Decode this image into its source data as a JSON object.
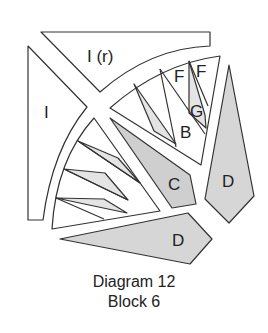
{
  "header_fragment": "(continuing...)",
  "diagram": {
    "pieces": [
      {
        "id": "I-r",
        "label": "I (r)",
        "fill": "#ffffff"
      },
      {
        "id": "I",
        "label": "I",
        "fill": "#ffffff"
      },
      {
        "id": "F1",
        "label": "F",
        "fill": "#ffffff"
      },
      {
        "id": "F2",
        "label": "F",
        "fill": "#ffffff"
      },
      {
        "id": "G",
        "label": "G",
        "fill": "#e4e4e4"
      },
      {
        "id": "B",
        "label": "B",
        "fill": "#ffffff"
      },
      {
        "id": "C",
        "label": "C",
        "fill": "#cfcfcf"
      },
      {
        "id": "D1",
        "label": "D",
        "fill": "#d6d6d6"
      },
      {
        "id": "D2",
        "label": "D",
        "fill": "#d6d6d6"
      }
    ],
    "colors": {
      "stroke": "#333333",
      "light_fill": "#e6e6e6",
      "mid_fill": "#d2d2d2",
      "white": "#ffffff"
    }
  },
  "caption": {
    "line1": "Diagram 12",
    "line2": "Block 6"
  }
}
